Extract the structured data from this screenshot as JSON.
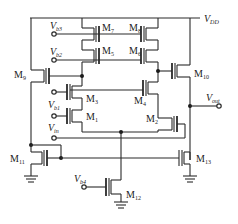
{
  "diagram": {
    "type": "transistor-level op-amp schematic",
    "supply": {
      "main": "V",
      "sub": "DD"
    },
    "output": {
      "main": "V",
      "sub": "out"
    },
    "inputs": [
      {
        "id": "vb3",
        "main": "V",
        "sub": "b3"
      },
      {
        "id": "vb2",
        "main": "V",
        "sub": "b2"
      },
      {
        "id": "vb1",
        "main": "V",
        "sub": "b1"
      },
      {
        "id": "vin",
        "main": "V",
        "sub": "in"
      },
      {
        "id": "vb4",
        "main": "V",
        "sub": "b4"
      }
    ],
    "transistors": [
      {
        "id": "m1",
        "main": "M",
        "sub": "1"
      },
      {
        "id": "m2",
        "main": "M",
        "sub": "2"
      },
      {
        "id": "m3",
        "main": "M",
        "sub": "3"
      },
      {
        "id": "m4",
        "main": "M",
        "sub": "4"
      },
      {
        "id": "m5",
        "main": "M",
        "sub": "5"
      },
      {
        "id": "m6",
        "main": "M",
        "sub": "6"
      },
      {
        "id": "m7",
        "main": "M",
        "sub": "7"
      },
      {
        "id": "m8",
        "main": "M",
        "sub": "8"
      },
      {
        "id": "m9",
        "main": "M",
        "sub": "9"
      },
      {
        "id": "m10",
        "main": "M",
        "sub": "10"
      },
      {
        "id": "m11",
        "main": "M",
        "sub": "11"
      },
      {
        "id": "m12",
        "main": "M",
        "sub": "12"
      },
      {
        "id": "m13",
        "main": "M",
        "sub": "13"
      }
    ]
  }
}
